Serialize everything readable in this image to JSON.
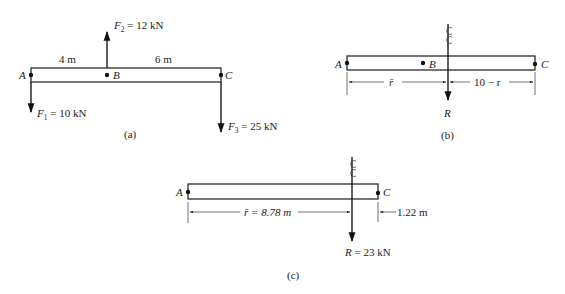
{
  "figures": [
    {
      "id": "a",
      "caption": "(a)",
      "points": {
        "A": "A",
        "B": "B",
        "C": "C"
      },
      "dimensions": {
        "AB": "4 m",
        "BC": "6 m"
      },
      "forces": [
        {
          "name": "F",
          "sub": "1",
          "value": " = 10 kN",
          "direction": "down",
          "at": "A"
        },
        {
          "name": "F",
          "sub": "2",
          "value": " = 12 kN",
          "direction": "up",
          "at": "B"
        },
        {
          "name": "F",
          "sub": "3",
          "value": " = 25 kN",
          "direction": "down",
          "at": "C"
        }
      ]
    },
    {
      "id": "b",
      "caption": "(b)",
      "points": {
        "A": "A",
        "B": "B",
        "C": "C"
      },
      "dimensions": {
        "left": "r̄",
        "right": "10 − r"
      },
      "resultant": {
        "name": "R",
        "value": ""
      },
      "centerline_symbol": "℄"
    },
    {
      "id": "c",
      "caption": "(c)",
      "points": {
        "A": "A",
        "C": "C"
      },
      "dimensions": {
        "left": "r̄ = 8.78 m",
        "right": "1.22 m"
      },
      "resultant": {
        "name": "R",
        "value": " = 23 kN"
      },
      "centerline_symbol": "℄"
    }
  ]
}
